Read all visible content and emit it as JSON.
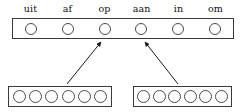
{
  "diagram": {
    "title": "",
    "output_layer": {
      "name": "output-layer",
      "labels": [
        "uit",
        "af",
        "op",
        "aan",
        "in",
        "om"
      ],
      "unit_count": 6,
      "units": [
        {
          "index": 0,
          "label": "uit",
          "state": "empty"
        },
        {
          "index": 1,
          "label": "af",
          "state": "empty"
        },
        {
          "index": 2,
          "label": "op",
          "state": "empty"
        },
        {
          "index": 3,
          "label": "aan",
          "state": "empty"
        },
        {
          "index": 4,
          "label": "in",
          "state": "empty"
        },
        {
          "index": 5,
          "label": "om",
          "state": "empty"
        }
      ]
    },
    "input_layers": [
      {
        "name": "input-layer-left",
        "unit_count": 6,
        "units": [
          {
            "index": 0,
            "state": "empty"
          },
          {
            "index": 1,
            "state": "empty"
          },
          {
            "index": 2,
            "state": "empty"
          },
          {
            "index": 3,
            "state": "empty"
          },
          {
            "index": 4,
            "state": "empty"
          },
          {
            "index": 5,
            "state": "empty"
          }
        ]
      },
      {
        "name": "input-layer-right",
        "unit_count": 6,
        "units": [
          {
            "index": 0,
            "state": "empty"
          },
          {
            "index": 1,
            "state": "empty"
          },
          {
            "index": 2,
            "state": "empty"
          },
          {
            "index": 3,
            "state": "empty"
          },
          {
            "index": 4,
            "state": "empty"
          },
          {
            "index": 5,
            "state": "empty"
          }
        ]
      }
    ],
    "arrows": [
      {
        "name": "arrow-left-to-op",
        "from_layer": "input-layer-left",
        "to_label": "op",
        "x1": 67,
        "y1": 84,
        "x2": 101,
        "y2": 42
      },
      {
        "name": "arrow-right-to-aan",
        "from_layer": "input-layer-right",
        "to_label": "aan",
        "x1": 178,
        "y1": 84,
        "x2": 145,
        "y2": 42
      }
    ],
    "colors": {
      "stroke": "#3a3a3a",
      "unit_stroke": "#4a4a4a",
      "arrow": "#1a1a1a",
      "text": "#111111",
      "background": "#ffffff"
    }
  }
}
